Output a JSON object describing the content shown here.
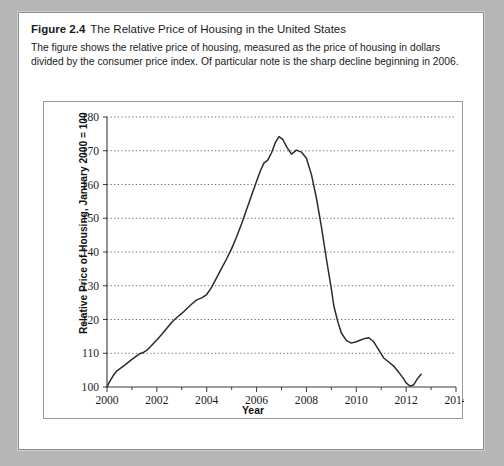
{
  "figure": {
    "label": "Figure 2.4",
    "title": "The Relative Price of Housing in the United States",
    "description": "The figure shows the relative price of housing, measured as the price of housing in dollars divided by the consumer price index. Of particular note is the sharp decline beginning in 2006."
  },
  "chart_data": {
    "type": "line",
    "title": "The Relative Price of Housing in the United States",
    "xlabel": "Year",
    "ylabel": "Relative Price of Housing, January 2000 = 100",
    "xlim": [
      2000,
      2014
    ],
    "ylim": [
      100,
      180
    ],
    "xticks": [
      2000,
      2002,
      2004,
      2006,
      2008,
      2010,
      2012,
      2014
    ],
    "xtick_labels": [
      "2000",
      "2002",
      "2004",
      "2006",
      "2008",
      "2010",
      "2012",
      "2014"
    ],
    "yticks": [
      100,
      110,
      120,
      130,
      140,
      150,
      160,
      170,
      180
    ],
    "ytick_labels": [
      "100",
      "110",
      "120",
      "130",
      "140",
      "150",
      "160",
      "170",
      "180"
    ],
    "grid": "horizontal-dotted",
    "legend": null,
    "line_color": "#2b2b2b",
    "series": [
      {
        "name": "Relative Price of Housing",
        "x": [
          2000.0,
          2000.1,
          2000.25,
          2000.4,
          2000.55,
          2000.7,
          2000.85,
          2001.0,
          2001.15,
          2001.3,
          2001.45,
          2001.6,
          2001.75,
          2001.9,
          2002.05,
          2002.2,
          2002.4,
          2002.6,
          2002.8,
          2003.0,
          2003.2,
          2003.4,
          2003.6,
          2003.8,
          2004.0,
          2004.2,
          2004.4,
          2004.6,
          2004.8,
          2005.0,
          2005.2,
          2005.4,
          2005.6,
          2005.8,
          2006.0,
          2006.15,
          2006.3,
          2006.45,
          2006.6,
          2006.75,
          2006.9,
          2007.05,
          2007.2,
          2007.4,
          2007.6,
          2007.8,
          2008.0,
          2008.2,
          2008.4,
          2008.6,
          2008.8,
          2009.0,
          2009.1,
          2009.25,
          2009.4,
          2009.6,
          2009.8,
          2010.0,
          2010.2,
          2010.35,
          2010.5,
          2010.7,
          2010.9,
          2011.1,
          2011.3,
          2011.5,
          2011.7,
          2011.9,
          2012.0,
          2012.15,
          2012.3,
          2012.45,
          2012.6
        ],
        "y": [
          100.0,
          101.5,
          103.4,
          104.8,
          105.6,
          106.4,
          107.3,
          108.2,
          109.0,
          109.8,
          110.2,
          110.9,
          112.0,
          113.2,
          114.4,
          115.6,
          117.4,
          119.2,
          120.6,
          121.8,
          123.2,
          124.6,
          125.8,
          126.4,
          127.4,
          129.6,
          132.4,
          135.2,
          138.0,
          141.0,
          144.5,
          148.4,
          152.6,
          156.8,
          161.0,
          164.0,
          166.4,
          167.2,
          169.4,
          172.4,
          174.2,
          173.4,
          171.2,
          169.0,
          170.2,
          169.6,
          167.8,
          163.0,
          156.0,
          147.5,
          138.0,
          129.0,
          124.0,
          119.6,
          116.0,
          113.8,
          113.0,
          113.4,
          114.0,
          114.4,
          114.6,
          113.4,
          111.0,
          108.6,
          107.4,
          106.2,
          104.4,
          102.4,
          101.2,
          100.3,
          100.6,
          102.4,
          103.8
        ]
      }
    ],
    "annotations": [
      {
        "text": "peak of relative housing price",
        "approx_x": 2006.9,
        "approx_y": 174.2
      },
      {
        "text": "trough",
        "approx_x": 2012.15,
        "approx_y": 100.3
      }
    ]
  }
}
